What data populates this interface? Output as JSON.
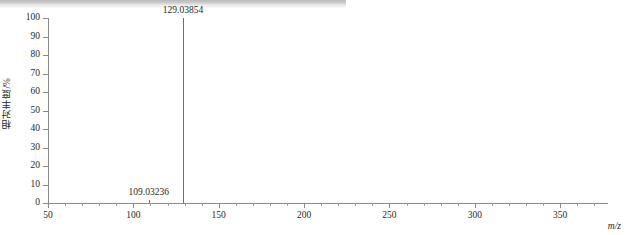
{
  "chart_data": {
    "type": "bar",
    "title": "",
    "subtitle": "",
    "xlabel": "m/z",
    "ylabel": "相对丰度/%",
    "xlim": [
      50,
      378
    ],
    "ylim": [
      0,
      100
    ],
    "grid": false,
    "legend": null,
    "x_major_ticks": [
      50,
      100,
      150,
      200,
      250,
      300,
      350
    ],
    "x_major_tick_labels": [
      "50",
      "100",
      "150",
      "200",
      "250",
      "300",
      "350"
    ],
    "x_minor_tick_step": 10,
    "y_ticks": [
      0,
      10,
      20,
      30,
      40,
      50,
      60,
      70,
      80,
      90,
      100
    ],
    "y_tick_labels": [
      "0",
      "10",
      "20",
      "30",
      "40",
      "50",
      "60",
      "70",
      "80",
      "90",
      "100"
    ],
    "peaks": [
      {
        "mz": 129.03854,
        "label": "129.03854",
        "intensity": 100.0
      },
      {
        "mz": 109.03236,
        "label": "109.03236",
        "intensity": 1.6
      }
    ],
    "annotations": [
      {
        "text": "129.03854",
        "mz": 129.03854,
        "intensity": 100.0
      },
      {
        "text": "109.03236",
        "mz": 109.03236,
        "intensity": 1.6
      }
    ],
    "colors": {
      "peak": "#6e6e6e",
      "axis": "#8a8a8a",
      "text": "#1f1f1f",
      "background": "#ffffff",
      "topbar": "#c9c9c9"
    }
  }
}
